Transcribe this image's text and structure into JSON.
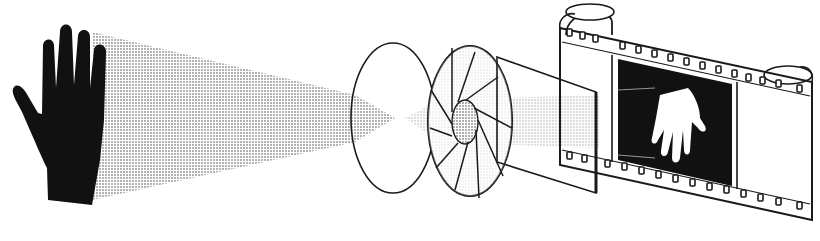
{
  "diagram": {
    "kind": "camera-imaging-process",
    "components": [
      {
        "id": "subject",
        "semantic": "hand-silhouette"
      },
      {
        "id": "light-cone",
        "semantic": "light-rays"
      },
      {
        "id": "lens",
        "semantic": "lens-disc"
      },
      {
        "id": "aperture",
        "semantic": "iris-diaphragm"
      },
      {
        "id": "shutter",
        "semantic": "shutter-plate"
      },
      {
        "id": "film",
        "semantic": "film-strip"
      },
      {
        "id": "image",
        "semantic": "inverted-negative-hand"
      }
    ],
    "colors": {
      "ink": "#1a1a1a",
      "paper": "#ffffff",
      "halftone": "#9a9a9a"
    }
  }
}
